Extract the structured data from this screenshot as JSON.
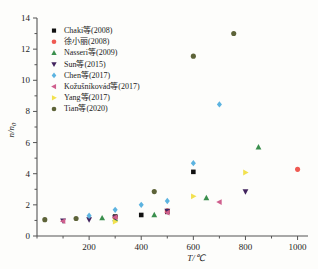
{
  "chart_data": {
    "type": "scatter",
    "title": "",
    "xlabel": "T/℃",
    "ylabel": "n/n₀",
    "xlim": [
      0,
      1040
    ],
    "ylim": [
      0,
      14
    ],
    "xticks": [
      200,
      400,
      600,
      800,
      1000
    ],
    "xtick_labels": [
      "200",
      "400",
      "600",
      "800",
      "1000"
    ],
    "yticks": [
      0,
      2,
      4,
      6,
      8,
      10,
      12,
      14
    ],
    "ytick_labels": [
      "0",
      "2",
      "4",
      "6",
      "8",
      "10",
      "12",
      "14"
    ],
    "grid": false,
    "legend_position": "upper-left",
    "series": [
      {
        "name": "Chaki等(2008)",
        "marker": "square",
        "color": "#111111",
        "points": [
          {
            "x": 300,
            "y": 1.25
          },
          {
            "x": 400,
            "y": 1.35
          },
          {
            "x": 500,
            "y": 1.55
          },
          {
            "x": 600,
            "y": 4.12
          }
        ]
      },
      {
        "name": "徐小丽(2008)",
        "marker": "circle",
        "color": "#ef5a52",
        "points": [
          {
            "x": 300,
            "y": 1.2
          },
          {
            "x": 500,
            "y": 1.62
          },
          {
            "x": 1000,
            "y": 4.28
          }
        ]
      },
      {
        "name": "Nasseri等(2009)",
        "marker": "triangle-up",
        "color": "#3a8f4d",
        "points": [
          {
            "x": 250,
            "y": 1.15
          },
          {
            "x": 300,
            "y": 1.1
          },
          {
            "x": 450,
            "y": 1.35
          },
          {
            "x": 650,
            "y": 2.45
          },
          {
            "x": 850,
            "y": 5.7
          }
        ]
      },
      {
        "name": "Sun等(2015)",
        "marker": "triangle-down",
        "color": "#42245e",
        "points": [
          {
            "x": 100,
            "y": 0.98
          },
          {
            "x": 200,
            "y": 1.05
          },
          {
            "x": 300,
            "y": 1.18
          },
          {
            "x": 500,
            "y": 1.6
          },
          {
            "x": 800,
            "y": 2.85
          }
        ]
      },
      {
        "name": "Chen等(2017)",
        "marker": "diamond",
        "color": "#5cb3e0",
        "points": [
          {
            "x": 200,
            "y": 1.3
          },
          {
            "x": 300,
            "y": 1.68
          },
          {
            "x": 400,
            "y": 2.0
          },
          {
            "x": 500,
            "y": 2.25
          },
          {
            "x": 600,
            "y": 4.68
          },
          {
            "x": 700,
            "y": 8.45
          }
        ]
      },
      {
        "name": "Kožušníkovád等(2017)",
        "marker": "triangle-left",
        "color": "#cf5f8d",
        "points": [
          {
            "x": 100,
            "y": 0.95
          },
          {
            "x": 300,
            "y": 1.2
          },
          {
            "x": 500,
            "y": 1.5
          },
          {
            "x": 700,
            "y": 2.18
          }
        ]
      },
      {
        "name": "Yang等(2017)",
        "marker": "triangle-right",
        "color": "#f2e14e",
        "points": [
          {
            "x": 300,
            "y": 0.92
          },
          {
            "x": 600,
            "y": 2.55
          },
          {
            "x": 800,
            "y": 4.08
          }
        ]
      },
      {
        "name": "Tian等(2020)",
        "marker": "circle",
        "color": "#5d6338",
        "points": [
          {
            "x": 30,
            "y": 1.05
          },
          {
            "x": 150,
            "y": 1.12
          },
          {
            "x": 450,
            "y": 2.85
          },
          {
            "x": 600,
            "y": 11.55
          },
          {
            "x": 755,
            "y": 13.0
          }
        ]
      }
    ]
  }
}
